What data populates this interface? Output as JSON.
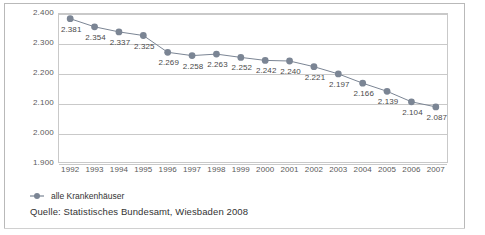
{
  "chart_data": {
    "type": "line",
    "title": "",
    "xlabel": "",
    "ylabel": "",
    "categories": [
      "1992",
      "1993",
      "1994",
      "1995",
      "1996",
      "1997",
      "1998",
      "1999",
      "2000",
      "2001",
      "2002",
      "2003",
      "2004",
      "2005",
      "2006",
      "2007"
    ],
    "series": [
      {
        "name": "alle Krankenhäuser",
        "values": [
          2381,
          2354,
          2337,
          2325,
          2269,
          2258,
          2263,
          2252,
          2242,
          2240,
          2221,
          2197,
          2166,
          2139,
          2104,
          2087
        ],
        "value_labels": [
          "2.381",
          "2.354",
          "2.337",
          "2.325",
          "2.269",
          "2.258",
          "2.263",
          "2.252",
          "2.242",
          "2.240",
          "2.221",
          "2.197",
          "2.166",
          "2.139",
          "2.104",
          "2.087"
        ],
        "color": "#7b8594",
        "marker": "circle"
      }
    ],
    "ylim": [
      1900,
      2400
    ],
    "yticks": [
      2400,
      2300,
      2200,
      2100,
      2000,
      1900
    ],
    "ytick_labels": [
      "2.400",
      "2.300",
      "2.200",
      "2.100",
      "2.000",
      "1.900"
    ],
    "grid": true,
    "legend_position": "bottom-left"
  },
  "legend": {
    "entries": [
      {
        "label": "alle Krankenhäuser",
        "color": "#7b8594"
      }
    ]
  },
  "footer": {
    "source": "Quelle: Statistisches Bundesamt, Wiesbaden 2008"
  },
  "colors": {
    "series": "#7b8594",
    "grid": "#c9c9c9",
    "frame": "#b9b9b9",
    "text": "#5a5a5a"
  }
}
